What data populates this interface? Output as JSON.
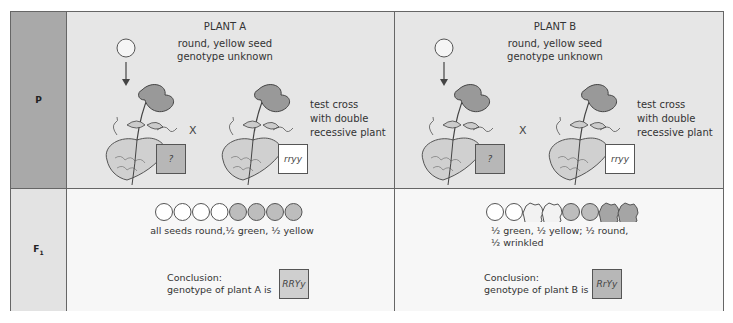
{
  "rows": {
    "p_label": "P",
    "f1_label": "F",
    "f1_sub": "1"
  },
  "plant_a": {
    "title": "PLANT A",
    "desc_line1": "round, yellow seed",
    "desc_line2": "genotype unknown",
    "cross_symbol": "X",
    "test_cross": [
      "test cross",
      "with double",
      "recessive plant"
    ],
    "unknown_box": "?",
    "recessive_box": "rryy",
    "seeds": [
      "white-round",
      "white-round",
      "white-round",
      "white-round",
      "gray-round",
      "gray-round",
      "gray-round",
      "gray-round"
    ],
    "f1_desc": "all seeds round,½ green, ½ yellow",
    "conclusion_line1": "Conclusion:",
    "conclusion_line2": "genotype of plant A is",
    "genotype": "RRYy"
  },
  "plant_b": {
    "title": "PLANT B",
    "desc_line1": "round, yellow seed",
    "desc_line2": "genotype unknown",
    "cross_symbol": "X",
    "test_cross": [
      "test cross",
      "with double",
      "recessive plant"
    ],
    "unknown_box": "?",
    "recessive_box": "rryy",
    "seeds": [
      "white-round",
      "white-round",
      "white-wrinkled",
      "white-wrinkled",
      "gray-round",
      "gray-round",
      "gray-wrinkled",
      "gray-wrinkled"
    ],
    "f1_desc_line1": "½ green, ½ yellow; ½ round,",
    "f1_desc_line2": "½ wrinkled",
    "conclusion_line1": "Conclusion:",
    "conclusion_line2": "genotype of plant B is",
    "genotype": "RrYy"
  },
  "colors": {
    "label_p": "#a9a9a9",
    "label_f1": "#e3e3e3",
    "p_bg": "#e6e6e6",
    "f1_bg": "#f7f7f7",
    "green_seed": "#bdbdbd"
  }
}
